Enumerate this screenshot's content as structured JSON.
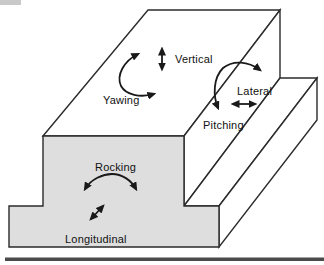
{
  "diagram": {
    "labels": {
      "vertical": "Vertical",
      "yawing": "Yawing",
      "lateral": "Lateral",
      "pitching": "Pitching",
      "rocking": "Rocking",
      "longitudinal": "Longitudinal"
    },
    "arrows": {
      "vertical": "double-headed-vertical-arrow",
      "yawing": "curved-double-headed-rotation-arrow",
      "lateral": "double-headed-horizontal-arrow",
      "pitching": "curved-double-headed-rotation-arrow",
      "rocking": "curved-double-headed-rotation-arrow",
      "longitudinal": "double-headed-diagonal-arrow"
    },
    "colors": {
      "front_face": "#dedede",
      "side_faces": "#ffffff",
      "line": "#2b2b2b",
      "arrow": "#1a1a1a",
      "ground_bar": "#4a4a4a",
      "background": "#ffffff"
    }
  }
}
